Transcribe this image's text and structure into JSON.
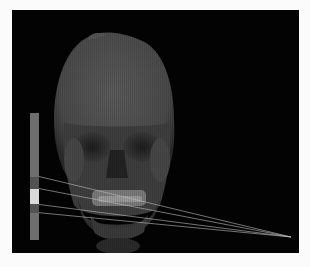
{
  "scene": {
    "subject": "skull-volume-render",
    "view": "frontal",
    "background_color": "#030303",
    "page_background": "#fbfbfb"
  },
  "depth_bar": {
    "segments": [
      {
        "name": "upper-range",
        "color": "#6e6e6e",
        "fraction": 0.5
      },
      {
        "name": "upper-margin",
        "color": "#525252",
        "fraction": 0.095
      },
      {
        "name": "selected-slab",
        "color": "#d9d9d9",
        "fraction": 0.125
      },
      {
        "name": "lower-margin",
        "color": "#525252",
        "fraction": 0.065
      },
      {
        "name": "lower-range",
        "color": "#6e6e6e",
        "fraction": 0.215
      }
    ]
  },
  "projection_lines": {
    "color": "#bdbdbd",
    "count": 4,
    "converge": "bottom-right"
  }
}
